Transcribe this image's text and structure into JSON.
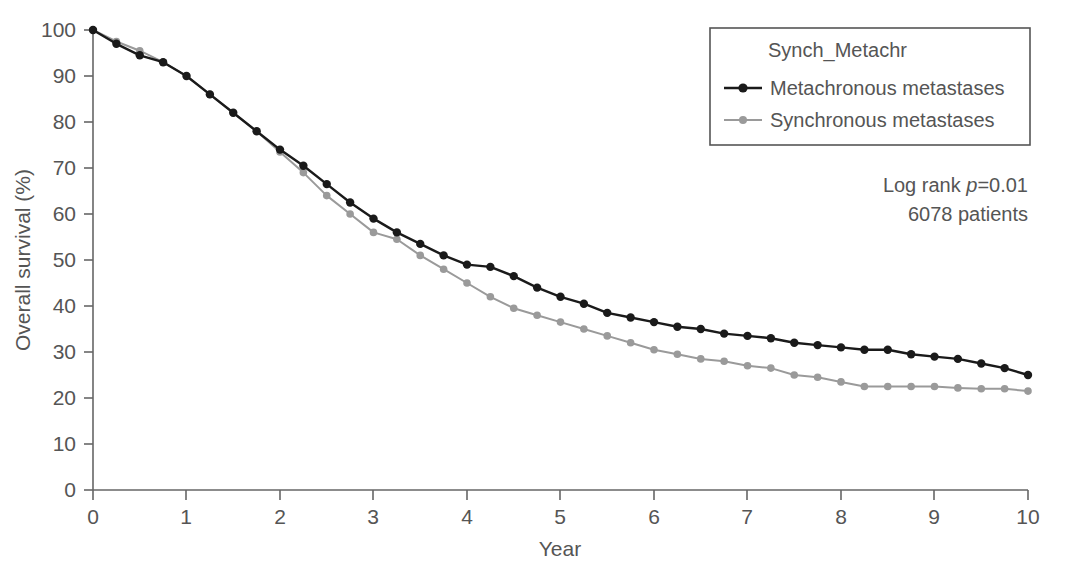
{
  "chart_data": {
    "type": "line",
    "title": "",
    "xlabel": "Year",
    "ylabel": "Overall survival (%)",
    "xlim": [
      0,
      10
    ],
    "ylim": [
      0,
      100
    ],
    "xticks": [
      "0",
      "1",
      "2",
      "3",
      "4",
      "5",
      "6",
      "7",
      "8",
      "9",
      "10"
    ],
    "yticks": [
      "0",
      "10",
      "20",
      "30",
      "40",
      "50",
      "60",
      "70",
      "80",
      "90",
      "100"
    ],
    "grid": false,
    "legend_position": "top-right",
    "legend_title": "Synch_Metachr",
    "x": [
      0,
      0.25,
      0.5,
      0.75,
      1.0,
      1.25,
      1.5,
      1.75,
      2.0,
      2.25,
      2.5,
      2.75,
      3.0,
      3.25,
      3.5,
      3.75,
      4.0,
      4.25,
      4.5,
      4.75,
      5.0,
      5.25,
      5.5,
      5.75,
      6.0,
      6.25,
      6.5,
      6.75,
      7.0,
      7.25,
      7.5,
      7.75,
      8.0,
      8.25,
      8.5,
      8.75,
      9.0,
      9.25,
      9.5,
      9.75,
      10.0
    ],
    "series": [
      {
        "name": "Metachronous metastases",
        "color": "#1a1a1a",
        "marker": "circle",
        "values": [
          100,
          97,
          94.5,
          93,
          90,
          86,
          82,
          78,
          74,
          70.5,
          66.5,
          62.5,
          59,
          56,
          53.5,
          51,
          49,
          48.5,
          46.5,
          44,
          42,
          40.5,
          38.5,
          37.5,
          36.5,
          35.5,
          35,
          34,
          33.5,
          33,
          32,
          31.5,
          31,
          30.5,
          30.5,
          29.5,
          29,
          28.5,
          27.5,
          26.5,
          25
        ]
      },
      {
        "name": "Synchronous metastases",
        "color": "#9a9a9a",
        "marker": "circle",
        "values": [
          100,
          97.5,
          95.5,
          93,
          90,
          86,
          82,
          78,
          73.5,
          69,
          64,
          60,
          56,
          54.5,
          51,
          48,
          45,
          42,
          39.5,
          38,
          36.5,
          35,
          33.5,
          32,
          30.5,
          29.5,
          28.5,
          28,
          27,
          26.5,
          25,
          24.5,
          23.5,
          22.5,
          22.5,
          22.5,
          22.5,
          22.2,
          22,
          22,
          21.5
        ]
      }
    ],
    "annotations": [
      {
        "text_prefix": "Log rank ",
        "text_italic": "p",
        "text_suffix": "=0.01"
      },
      {
        "text": "6078 patients"
      }
    ]
  },
  "annotation_lines": {
    "log_rank_prefix": "Log rank ",
    "log_rank_italic": "p",
    "log_rank_suffix": "=0.01",
    "patients": "6078 patients"
  }
}
